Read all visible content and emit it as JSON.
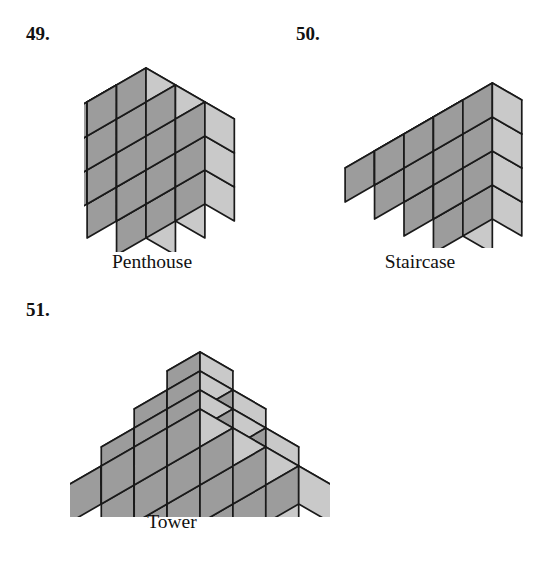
{
  "page": {
    "background_color": "#ffffff",
    "width": 543,
    "height": 564
  },
  "style": {
    "top_face_color": "#d2d2d2",
    "front_face_color": "#c9c9c9",
    "left_face_color": "#9c9c9c",
    "edge_color": "#1a1a1a",
    "text_color": "#111111"
  },
  "figures": [
    {
      "number": "49.",
      "caption": "Penthouse",
      "shape": "penthouse",
      "cube_unit": 34,
      "cube_count": 28,
      "dimensions": {
        "width": 3,
        "depth": 3,
        "height": 3,
        "extra_cubes": 1
      },
      "layers": [
        {
          "level": 0,
          "rows": [
            [
              1,
              1,
              1
            ],
            [
              1,
              1,
              1
            ],
            [
              1,
              1,
              1
            ]
          ]
        },
        {
          "level": 1,
          "rows": [
            [
              1,
              1,
              1
            ],
            [
              1,
              1,
              1
            ],
            [
              1,
              1,
              1
            ]
          ]
        },
        {
          "level": 2,
          "rows": [
            [
              1,
              1,
              1
            ],
            [
              1,
              1,
              1
            ],
            [
              1,
              1,
              1
            ]
          ]
        },
        {
          "level": 3,
          "rows": [
            [
              0,
              1,
              0
            ],
            [
              0,
              0,
              0
            ],
            [
              0,
              0,
              0
            ]
          ]
        }
      ]
    },
    {
      "number": "50.",
      "caption": "Staircase",
      "shape": "staircase",
      "cube_unit": 34,
      "cube_count": 20,
      "dimensions": {
        "width": 4,
        "depth": 2,
        "height": 4,
        "steps": 4
      },
      "step_heights": [
        1,
        2,
        3,
        4
      ]
    },
    {
      "number": "51.",
      "caption": "Tower",
      "shape": "tower",
      "cube_unit": 38,
      "cube_count": 30,
      "dimensions": {
        "base": 4,
        "height": 4
      },
      "layer_sizes": [
        4,
        3,
        2,
        1
      ]
    }
  ]
}
